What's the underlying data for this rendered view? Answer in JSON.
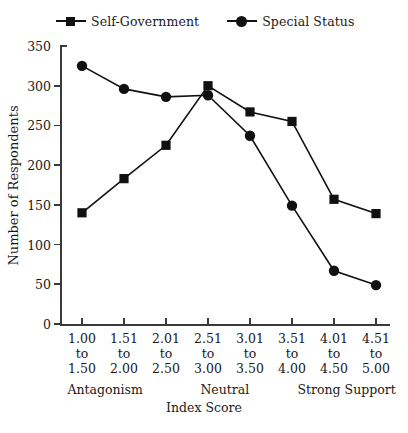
{
  "chart_data": {
    "type": "line",
    "title": "",
    "xlabel": "Index Score",
    "ylabel": "Number of Respondents",
    "categories": [
      "1.00\nto\n1.50",
      "1.51\nto\n2.00",
      "2.01\nto\n2.50",
      "2.51\nto\n3.00",
      "3.01\nto\n3.50",
      "3.51\nto\n4.00",
      "4.01\nto\n4.50",
      "4.51\nto\n5.00"
    ],
    "category_lines": [
      [
        "1.00",
        "to",
        "1.50"
      ],
      [
        "1.51",
        "to",
        "2.00"
      ],
      [
        "2.01",
        "to",
        "2.50"
      ],
      [
        "2.51",
        "to",
        "3.00"
      ],
      [
        "3.01",
        "to",
        "3.50"
      ],
      [
        "3.51",
        "to",
        "4.00"
      ],
      [
        "4.01",
        "to",
        "4.50"
      ],
      [
        "4.51",
        "to",
        "5.00"
      ]
    ],
    "series": [
      {
        "name": "Self-Government",
        "marker": "square",
        "values": [
          140,
          183,
          225,
          300,
          267,
          255,
          157,
          139
        ]
      },
      {
        "name": "Special Status",
        "marker": "circle",
        "values": [
          325,
          296,
          286,
          288,
          237,
          149,
          67,
          49
        ]
      }
    ],
    "ylim": [
      0,
      350
    ],
    "yticks": [
      0,
      50,
      100,
      150,
      200,
      250,
      300,
      350
    ],
    "ytick_labels": [
      "0",
      "50",
      "100",
      "150",
      "200",
      "250",
      "300",
      "350"
    ],
    "grid": false,
    "legend_position": "top",
    "anchor_labels": [
      {
        "text": "Antagonism",
        "category_index": 0.55
      },
      {
        "text": "Neutral",
        "category_index": 3.4
      },
      {
        "text": "Strong Support",
        "category_index": 6.3
      }
    ],
    "line_color": "#111111",
    "marker_color": "#111111"
  },
  "legend": {
    "entries": [
      {
        "label": "Self-Government",
        "marker": "square"
      },
      {
        "label": "Special Status",
        "marker": "circle"
      }
    ]
  },
  "axes": {
    "y_title": "Number of Respondents",
    "x_title": "Index Score"
  }
}
